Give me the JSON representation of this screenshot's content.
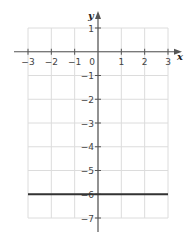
{
  "chart_data": {
    "type": "line",
    "title": "",
    "xlabel": "x",
    "ylabel": "y",
    "xlim": [
      -3,
      3
    ],
    "ylim": [
      -7,
      1
    ],
    "grid": true,
    "x_ticks": [
      -3,
      -2,
      -1,
      0,
      1,
      2,
      3
    ],
    "x_tick_labels": [
      "−3",
      "−2",
      "−1",
      "0",
      "1",
      "2",
      "3"
    ],
    "y_ticks": [
      1,
      -1,
      -2,
      -3,
      -4,
      -5,
      -6,
      -7
    ],
    "y_tick_labels": [
      "1",
      "−1",
      "−2",
      "−3",
      "−4",
      "−5",
      "−6",
      "−7"
    ],
    "series": [
      {
        "name": "y = -6",
        "x": [
          -3,
          3
        ],
        "y": [
          -6,
          -6
        ],
        "color": "#333333"
      }
    ]
  },
  "colors": {
    "grid": "#dcdcdc",
    "axis": "#555555",
    "series": "#333333"
  }
}
